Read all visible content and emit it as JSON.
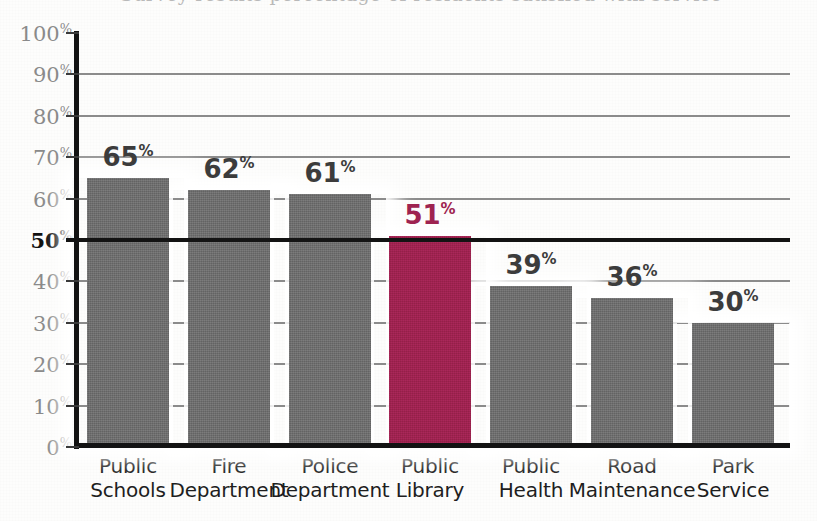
{
  "chart_data": {
    "type": "bar",
    "title": "",
    "xlabel": "",
    "ylabel": "",
    "ylim": [
      0,
      100
    ],
    "grid": true,
    "legend": "none",
    "orientation": "vertical",
    "value_suffix": "%",
    "categories": [
      "Public Schools",
      "Fire Department",
      "Police Department",
      "Public Library",
      "Public Health",
      "Road Maintenance",
      "Park Service"
    ],
    "category_lines": [
      [
        "Public",
        "Schools"
      ],
      [
        "Fire",
        "Department"
      ],
      [
        "Police",
        "Department"
      ],
      [
        "Public",
        "Library"
      ],
      [
        "Public",
        "Health"
      ],
      [
        "Road",
        "Maintenance"
      ],
      [
        "Park",
        "Service"
      ]
    ],
    "values": [
      65,
      62,
      61,
      51,
      39,
      36,
      30
    ],
    "value_labels": [
      "65",
      "62",
      "61",
      "51",
      "39",
      "36",
      "30"
    ],
    "highlighted_index": 3,
    "bar_colors": [
      "#6e6e6e",
      "#6e6e6e",
      "#6e6e6e",
      "#9e2350",
      "#6e6e6e",
      "#6e6e6e",
      "#6e6e6e"
    ],
    "yticks": [
      0,
      10,
      20,
      30,
      40,
      50,
      60,
      70,
      80,
      90,
      100
    ],
    "ytick_labels": [
      "0",
      "10",
      "20",
      "30",
      "40",
      "50",
      "60",
      "70",
      "80",
      "90",
      "100"
    ],
    "ytick_suffix": "%",
    "emphasized_ytick": 50,
    "reference_line": {
      "value": 50,
      "style": "thick-black",
      "label": "50"
    },
    "colors": {
      "bar_default": "#6e6e6e",
      "bar_highlight": "#9e2350",
      "gridline": "#8b8b8b",
      "axis": "#131313",
      "tick_label": "#8a8a8a",
      "tick_label_emphasis": "#111111",
      "value_label": "#3c3c3c",
      "category_label": "#1e1e1e",
      "background": "#fdfdfc"
    }
  },
  "title_strip": {
    "ghost_text": "Survey results percentage of residents satisfied with service"
  }
}
